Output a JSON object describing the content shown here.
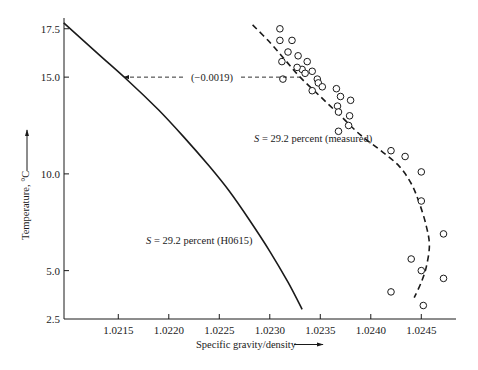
{
  "chart_data": {
    "type": "line",
    "title": "",
    "xlabel": "Specific gravity/density",
    "ylabel": "Temperature, °C",
    "xlim": [
      1.02096,
      1.02478
    ],
    "ylim": [
      2.5,
      17.8
    ],
    "grid": false,
    "legend": "none (inline curve labels)",
    "x_ticks": [
      1.0215,
      1.022,
      1.0225,
      1.023,
      1.0235,
      1.024,
      1.0245
    ],
    "x_tick_labels": [
      "1.0215",
      "1.0220",
      "1.0225",
      "1.0230",
      "1.0235",
      "1.0240",
      "1.0245"
    ],
    "y_ticks": [
      2.5,
      5.0,
      10.0,
      15.0,
      17.5
    ],
    "y_tick_labels": [
      "2.5",
      "5.0",
      "10.0",
      "15.0",
      "17.5"
    ],
    "series": [
      {
        "name": "S = 29.2 percent (H0615)",
        "style": "solid line",
        "points": [
          [
            1.02096,
            17.8
          ],
          [
            1.0213,
            16.2
          ],
          [
            1.0216,
            14.8
          ],
          [
            1.0219,
            13.3
          ],
          [
            1.02215,
            11.9
          ],
          [
            1.0224,
            10.4
          ],
          [
            1.0226,
            9.1
          ],
          [
            1.0228,
            7.6
          ],
          [
            1.023,
            6.0
          ],
          [
            1.02318,
            4.4
          ],
          [
            1.02332,
            3.0
          ]
        ]
      },
      {
        "name": "S = 29.2 percent (measured)",
        "style": "dashed line",
        "points": [
          [
            1.02283,
            17.7
          ],
          [
            1.023,
            16.8
          ],
          [
            1.02315,
            15.9
          ],
          [
            1.0233,
            15.0
          ],
          [
            1.0235,
            14.0
          ],
          [
            1.0237,
            13.0
          ],
          [
            1.0239,
            12.0
          ],
          [
            1.0241,
            11.2
          ],
          [
            1.02428,
            10.4
          ],
          [
            1.0244,
            9.5
          ],
          [
            1.02448,
            8.5
          ],
          [
            1.02455,
            7.3
          ],
          [
            1.02458,
            6.3
          ],
          [
            1.02455,
            5.2
          ],
          [
            1.0245,
            4.4
          ],
          [
            1.02443,
            3.6
          ]
        ]
      },
      {
        "name": "Measured data points",
        "style": "open circles",
        "points": [
          [
            1.0231,
            17.5
          ],
          [
            1.0231,
            16.9
          ],
          [
            1.02322,
            16.9
          ],
          [
            1.02318,
            16.3
          ],
          [
            1.02328,
            16.1
          ],
          [
            1.02337,
            15.8
          ],
          [
            1.02332,
            15.4
          ],
          [
            1.02312,
            15.8
          ],
          [
            1.02313,
            14.9
          ],
          [
            1.02342,
            15.3
          ],
          [
            1.02347,
            14.9
          ],
          [
            1.02348,
            14.7
          ],
          [
            1.02327,
            15.5
          ],
          [
            1.02335,
            15.2
          ],
          [
            1.02352,
            14.5
          ],
          [
            1.02342,
            14.3
          ],
          [
            1.02366,
            14.4
          ],
          [
            1.0237,
            14.0
          ],
          [
            1.0238,
            13.8
          ],
          [
            1.02367,
            13.5
          ],
          [
            1.02368,
            13.2
          ],
          [
            1.02379,
            13.0
          ],
          [
            1.02368,
            12.2
          ],
          [
            1.02378,
            12.5
          ],
          [
            1.0242,
            11.2
          ],
          [
            1.02434,
            10.9
          ],
          [
            1.0245,
            10.1
          ],
          [
            1.0245,
            8.6
          ],
          [
            1.02472,
            6.9
          ],
          [
            1.0244,
            5.6
          ],
          [
            1.0245,
            5.0
          ],
          [
            1.02472,
            4.6
          ],
          [
            1.0242,
            3.9
          ],
          [
            1.02452,
            3.2
          ]
        ]
      }
    ],
    "annotations": [
      {
        "text": "(−0.0019)",
        "type": "dashed arrow",
        "from": [
          1.0233,
          15.0
        ],
        "to": [
          1.02156,
          15.0
        ]
      },
      {
        "text": "S = 29.2 percent (measured)",
        "at": [
          1.02343,
          11.9
        ]
      },
      {
        "text": "S = 29.2 percent (H0615)",
        "at": [
          1.0222,
          6.3
        ]
      }
    ]
  },
  "labels": {
    "x_axis_title": "Specific gravity/density",
    "y_axis_title": "Temperature, °C",
    "offset_annotation": "(−0.0019)",
    "measured_label_italic": "S",
    "measured_label_rest": " = 29.2 percent (measured)",
    "model_label_italic": "S",
    "model_label_rest": " = 29.2 percent (H0615)"
  }
}
